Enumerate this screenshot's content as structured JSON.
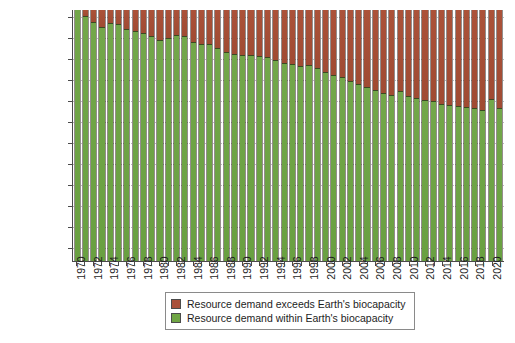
{
  "chart_data": {
    "type": "bar",
    "title": "",
    "subtitle": "",
    "xlabel": "",
    "ylabel": "",
    "grid": true,
    "legend_position": "bottom-center",
    "stacked": true,
    "y_axis": {
      "tick_labels": [
        "January",
        "February",
        "March",
        "April",
        "May",
        "June",
        "July",
        "August",
        "September",
        "October",
        "November",
        "December"
      ],
      "description": "Day of year at which Earth Overshoot Day falls; full bar height = one calendar year",
      "ylim": [
        0,
        365
      ]
    },
    "x_axis": {
      "tick_labels": [
        "1970",
        "1972",
        "1974",
        "1976",
        "1978",
        "1980",
        "1982",
        "1984",
        "1986",
        "1988",
        "1990",
        "1992",
        "1994",
        "1996",
        "1998",
        "2000",
        "2002",
        "2004",
        "2006",
        "2008",
        "2010",
        "2012",
        "2014",
        "2016",
        "2018",
        "2020"
      ],
      "tick_interval_years": 2,
      "range": [
        1970,
        2021
      ]
    },
    "series": [
      {
        "name": "Resource demand exceeds Earth's biocapacity",
        "color": "#a9503a",
        "role": "overshoot"
      },
      {
        "name": "Resource demand within Earth's biocapacity",
        "color": "#6fa544",
        "role": "within"
      }
    ],
    "categories": [
      1970,
      1971,
      1972,
      1973,
      1974,
      1975,
      1976,
      1977,
      1978,
      1979,
      1980,
      1981,
      1982,
      1983,
      1984,
      1985,
      1986,
      1987,
      1988,
      1989,
      1990,
      1991,
      1992,
      1993,
      1994,
      1995,
      1996,
      1997,
      1998,
      1999,
      2000,
      2001,
      2002,
      2003,
      2004,
      2005,
      2006,
      2007,
      2008,
      2009,
      2010,
      2011,
      2012,
      2013,
      2014,
      2015,
      2016,
      2017,
      2018,
      2019,
      2020,
      2021
    ],
    "values_day_of_year": [
      365,
      356,
      348,
      340,
      346,
      345,
      338,
      334,
      331,
      327,
      322,
      324,
      329,
      327,
      319,
      316,
      315,
      310,
      304,
      301,
      299,
      299,
      298,
      296,
      293,
      288,
      286,
      284,
      285,
      280,
      275,
      271,
      268,
      262,
      258,
      253,
      248,
      244,
      241,
      247,
      240,
      237,
      234,
      232,
      229,
      227,
      226,
      224,
      222,
      220,
      235,
      223
    ],
    "values_date_label": [
      "Dec 31",
      "Dec 22",
      "Dec 14",
      "Dec 6",
      "Dec 12",
      "Dec 11",
      "Dec 3",
      "Nov 30",
      "Nov 27",
      "Nov 23",
      "Nov 18",
      "Nov 20",
      "Nov 25",
      "Nov 23",
      "Nov 14",
      "Nov 12",
      "Nov 11",
      "Nov 6",
      "Oct 31",
      "Oct 28",
      "Oct 26",
      "Oct 26",
      "Oct 25",
      "Oct 23",
      "Oct 20",
      "Oct 15",
      "Oct 12",
      "Oct 11",
      "Oct 12",
      "Oct 7",
      "Oct 1",
      "Sep 28",
      "Sep 25",
      "Sep 19",
      "Sep 14",
      "Sep 10",
      "Sep 5",
      "Sep 1",
      "Aug 28",
      "Sep 4",
      "Aug 28",
      "Aug 25",
      "Aug 21",
      "Aug 20",
      "Aug 17",
      "Aug 15",
      "Aug 13",
      "Aug 12",
      "Aug 10",
      "Aug 8",
      "Aug 22",
      "Aug 11"
    ],
    "total_days_in_year": 365
  },
  "legend": {
    "items": [
      {
        "label": "Resource demand exceeds Earth's biocapacity",
        "color": "#a9503a"
      },
      {
        "label": "Resource demand within Earth's biocapacity",
        "color": "#6fa544"
      }
    ]
  },
  "colors": {
    "overshoot": "#a9503a",
    "within": "#6fa544",
    "axis": "#4a4a4a",
    "grid": "#b9b9b9",
    "background": "#ffffff",
    "text": "#1d1d1d"
  }
}
